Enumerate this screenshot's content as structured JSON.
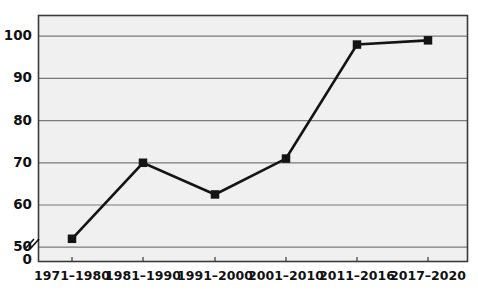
{
  "chart_data": {
    "type": "line",
    "title": "",
    "subtitle": "",
    "xlabel": "",
    "ylabel": "",
    "categories": [
      "1971–1980",
      "1981–1990",
      "1991–2000",
      "2001–2010",
      "2011–2016",
      "2017–2020"
    ],
    "values": [
      52,
      70,
      62.5,
      71,
      98,
      99
    ],
    "series": [
      {
        "name": "",
        "values": [
          52,
          70,
          62.5,
          71,
          98,
          99
        ]
      }
    ],
    "ylim": [
      50,
      105
    ],
    "yticks": [
      50,
      60,
      70,
      80,
      90,
      100
    ],
    "ytick_labels": [
      "50",
      "60",
      "70",
      "80",
      "90",
      "100"
    ],
    "y_zero_label": "0",
    "axis_break": true,
    "grid": true,
    "grid_axis": "y",
    "legend": false,
    "legend_position": "none",
    "marker": "square",
    "annotations": []
  },
  "style": {
    "plot_background": "#f0f0f0",
    "frame_color": "#3a3a3a",
    "grid_color": "#7a7a7a",
    "line_color": "#141414",
    "marker_color": "#141414",
    "text_color": "#111111",
    "page_background": "#ffffff"
  },
  "geometry": {
    "plot_left": 38,
    "plot_right": 468,
    "plot_top": 15,
    "plot_bottom": 262,
    "y_value_top": 105,
    "y_value_bottom": 46.5,
    "x_positions": [
      72,
      143,
      215,
      286,
      357,
      428
    ]
  }
}
